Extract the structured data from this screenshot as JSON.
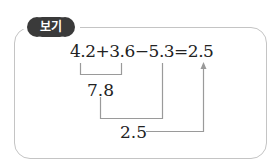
{
  "badge": {
    "label": "보기"
  },
  "example": {
    "equation": "4.2+3.6−5.3=2.5",
    "step1_result": "7.8",
    "step2_result": "2.5"
  },
  "colors": {
    "badge_bg": "#3a3a3a",
    "badge_text": "#ffffff",
    "frame_border": "#c4c4c4",
    "connector_lines": "#9a9a9a",
    "text": "#222222"
  }
}
